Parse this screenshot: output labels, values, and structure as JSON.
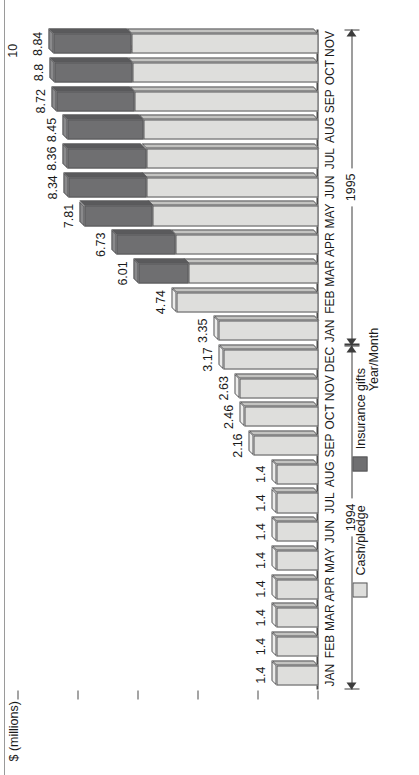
{
  "chart_data": {
    "type": "bar",
    "subtype": "stacked-horizontal-3d",
    "title": "",
    "xlabel": "Year/Month",
    "ylabel": "$ (millions)",
    "ylim": [
      0,
      10
    ],
    "yticks": [
      "0",
      "2",
      "4",
      "6",
      "8",
      "10"
    ],
    "grid": false,
    "legend_position": "below-plot",
    "orientation": "page-rotated-90-ccw",
    "categories": [
      "JAN",
      "FEB",
      "MAR",
      "APR",
      "MAY",
      "JUN",
      "JUL",
      "AUG",
      "SEP",
      "OCT",
      "NOV",
      "DEC",
      "JAN",
      "FEB",
      "MAR",
      "APR",
      "MAY",
      "JUN",
      "JUL",
      "AUG",
      "SEP",
      "OCT",
      "NOV"
    ],
    "groups": [
      {
        "label": "1994",
        "start": 0,
        "end": 11
      },
      {
        "label": "1995",
        "start": 12,
        "end": 22
      }
    ],
    "series": [
      {
        "name": "Cash/pledge",
        "color": "#dededc",
        "values": [
          1.4,
          1.4,
          1.4,
          1.4,
          1.4,
          1.4,
          1.4,
          1.4,
          2.16,
          2.46,
          2.63,
          3.17,
          3.35,
          4.74,
          4.32,
          4.76,
          5.52,
          5.72,
          5.75,
          5.83,
          6.13,
          6.2,
          6.24
        ]
      },
      {
        "name": "Insurance gifts",
        "color": "#6f6f71",
        "values": [
          0,
          0,
          0,
          0,
          0,
          0,
          0,
          0,
          0,
          0,
          0,
          0,
          0,
          0,
          1.69,
          1.97,
          2.29,
          2.62,
          2.61,
          2.53,
          2.59,
          2.6,
          2.6
        ]
      }
    ],
    "totals": [
      "1.4",
      "1.4",
      "1.4",
      "1.4",
      "1.4",
      "1.4",
      "1.4",
      "1.4",
      "2.16",
      "2.46",
      "2.63",
      "3.17",
      "3.35",
      "4.74",
      "6.01",
      "6.73",
      "7.81",
      "8.34",
      "8.36",
      "8.45",
      "8.72",
      "8.8",
      "8.84"
    ],
    "total_values": [
      1.4,
      1.4,
      1.4,
      1.4,
      1.4,
      1.4,
      1.4,
      1.4,
      2.16,
      2.46,
      2.63,
      3.17,
      3.35,
      4.74,
      6.01,
      6.73,
      7.81,
      8.34,
      8.36,
      8.45,
      8.72,
      8.8,
      8.84
    ]
  },
  "legend": {
    "items": [
      {
        "label": "Cash/pledge",
        "swatch": "cash"
      },
      {
        "label": "Insurance gifts",
        "swatch": "ins"
      }
    ]
  },
  "axes": {
    "value_axis_title": "$ (millions)",
    "category_axis_title": "Year/Month"
  }
}
